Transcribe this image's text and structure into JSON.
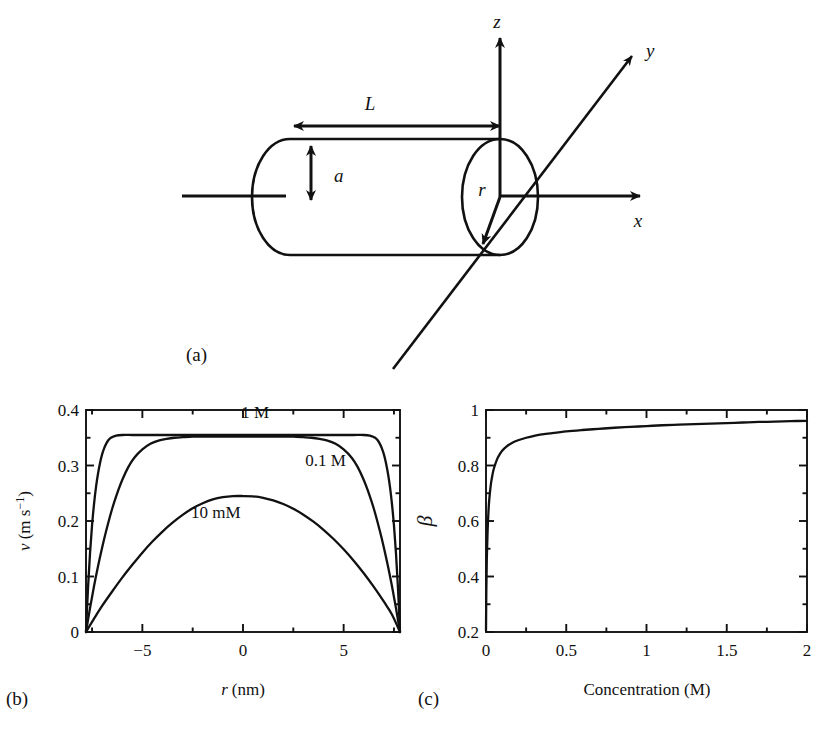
{
  "figure": {
    "panels": [
      {
        "id": "a",
        "label": "(a)"
      },
      {
        "id": "b",
        "label": "(b)"
      },
      {
        "id": "c",
        "label": "(c)"
      }
    ]
  },
  "diagram": {
    "name": "cylindrical-nanopore-schematic",
    "labels": {
      "length": "L",
      "radius_dim": "a",
      "radial_coord": "r",
      "axis_x": "x",
      "axis_y": "y",
      "axis_z": "z"
    }
  },
  "chart_data": [
    {
      "id": "panel-b",
      "type": "line",
      "title": "",
      "xlabel": "r (nm)",
      "xlabel_italic": "r",
      "xlabel_unit": "(nm)",
      "ylabel": "v (m s⁻¹)",
      "ylabel_italic": "v",
      "ylabel_unit": "(m s⁻¹)",
      "xlim": [
        -7.8,
        7.8
      ],
      "ylim": [
        0,
        0.4
      ],
      "xticks": [
        -5,
        0,
        5
      ],
      "xtick_labels": [
        "−5",
        "0",
        "5"
      ],
      "xminorticks": [
        -7.5,
        -2.5,
        2.5,
        7.5
      ],
      "yticks": [
        0,
        0.1,
        0.2,
        0.3,
        0.4
      ],
      "ytick_labels": [
        "0",
        "0.1",
        "0.2",
        "0.3",
        "0.4"
      ],
      "yminorticks": [
        0.05,
        0.15,
        0.25,
        0.35
      ],
      "grid": false,
      "legend_position": "inline-annotations",
      "series": [
        {
          "name": "1 M",
          "label_x": 0.6,
          "label_y": 0.385,
          "plateau": 0.355,
          "x": [
            -7.8,
            -7.7,
            -7.6,
            -7.5,
            -7.4,
            -7.3,
            -7.2,
            -7.1,
            -7.0,
            -6.9,
            -6.8,
            -6.7,
            -6.6,
            -6.5,
            -6.3,
            -6.0,
            -5.5,
            -5.0,
            -4.0,
            -3.0,
            -2.0,
            -1.0,
            0.0,
            1.0,
            2.0,
            3.0,
            4.0,
            5.0,
            5.5,
            6.0,
            6.3,
            6.5,
            6.6,
            6.7,
            6.8,
            6.9,
            7.0,
            7.1,
            7.2,
            7.3,
            7.4,
            7.5,
            7.6,
            7.7,
            7.8
          ],
          "y": [
            0.0,
            0.079,
            0.142,
            0.192,
            0.231,
            0.262,
            0.286,
            0.305,
            0.32,
            0.331,
            0.339,
            0.345,
            0.349,
            0.351,
            0.354,
            0.355,
            0.355,
            0.355,
            0.355,
            0.355,
            0.355,
            0.355,
            0.355,
            0.355,
            0.355,
            0.355,
            0.355,
            0.355,
            0.355,
            0.355,
            0.354,
            0.351,
            0.349,
            0.345,
            0.339,
            0.331,
            0.32,
            0.305,
            0.286,
            0.262,
            0.231,
            0.192,
            0.142,
            0.079,
            0.0
          ]
        },
        {
          "name": "0.1 M",
          "label_x": 4.1,
          "label_y": 0.3,
          "plateau": 0.352,
          "x": [
            -7.8,
            -7.6,
            -7.4,
            -7.2,
            -7.0,
            -6.8,
            -6.5,
            -6.2,
            -6.0,
            -5.7,
            -5.4,
            -5.0,
            -4.6,
            -4.2,
            -3.8,
            -3.4,
            -3.0,
            -2.5,
            -2.0,
            -1.5,
            -1.0,
            -0.5,
            0.0,
            0.5,
            1.0,
            1.5,
            2.0,
            2.5,
            3.0,
            3.4,
            3.8,
            4.2,
            4.6,
            5.0,
            5.4,
            5.7,
            6.0,
            6.2,
            6.5,
            6.8,
            7.0,
            7.2,
            7.4,
            7.6,
            7.8
          ],
          "y": [
            0.0,
            0.043,
            0.083,
            0.119,
            0.152,
            0.182,
            0.222,
            0.255,
            0.274,
            0.297,
            0.314,
            0.329,
            0.339,
            0.345,
            0.348,
            0.35,
            0.351,
            0.352,
            0.352,
            0.352,
            0.352,
            0.352,
            0.352,
            0.352,
            0.352,
            0.352,
            0.352,
            0.352,
            0.351,
            0.35,
            0.348,
            0.345,
            0.339,
            0.329,
            0.314,
            0.297,
            0.274,
            0.255,
            0.222,
            0.182,
            0.152,
            0.119,
            0.083,
            0.043,
            0.0
          ]
        },
        {
          "name": "10 mM",
          "label_x": -1.35,
          "label_y": 0.205,
          "peak": 0.245,
          "x": [
            -7.8,
            -7.4,
            -7.0,
            -6.5,
            -6.0,
            -5.5,
            -5.0,
            -4.5,
            -4.0,
            -3.5,
            -3.0,
            -2.5,
            -2.0,
            -1.5,
            -1.0,
            -0.5,
            0.0,
            0.5,
            1.0,
            1.5,
            2.0,
            2.5,
            3.0,
            3.5,
            4.0,
            4.5,
            5.0,
            5.5,
            6.0,
            6.5,
            7.0,
            7.4,
            7.8
          ],
          "y": [
            0.0,
            0.024,
            0.047,
            0.073,
            0.098,
            0.121,
            0.143,
            0.163,
            0.181,
            0.197,
            0.211,
            0.223,
            0.232,
            0.239,
            0.243,
            0.2449,
            0.245,
            0.2444,
            0.2418,
            0.2372,
            0.2306,
            0.222,
            0.2114,
            0.1988,
            0.1842,
            0.1676,
            0.149,
            0.1284,
            0.1058,
            0.0812,
            0.0546,
            0.0316,
            0.0
          ]
        }
      ]
    },
    {
      "id": "panel-c",
      "type": "line",
      "title": "",
      "xlabel": "Concentration (M)",
      "ylabel": "β",
      "xlim": [
        0,
        2
      ],
      "ylim": [
        0.2,
        1
      ],
      "xticks": [
        0,
        0.5,
        1,
        1.5,
        2
      ],
      "xtick_labels": [
        "0",
        "0.5",
        "1",
        "1.5",
        "2"
      ],
      "xminorticks": [
        0.25,
        0.75,
        1.25,
        1.75
      ],
      "yticks": [
        0.2,
        0.4,
        0.6,
        0.8,
        1
      ],
      "ytick_labels": [
        "0.2",
        "0.4",
        "0.6",
        "0.8",
        "1"
      ],
      "yminorticks": [
        0.3,
        0.5,
        0.7,
        0.9
      ],
      "grid": false,
      "legend_position": "none",
      "series": [
        {
          "name": "beta-vs-concentration",
          "x": [
            0.0,
            0.002,
            0.005,
            0.01,
            0.015,
            0.02,
            0.03,
            0.04,
            0.05,
            0.07,
            0.09,
            0.11,
            0.14,
            0.17,
            0.2,
            0.25,
            0.3,
            0.35,
            0.4,
            0.5,
            0.6,
            0.7,
            0.8,
            0.9,
            1.0,
            1.1,
            1.2,
            1.3,
            1.4,
            1.5,
            1.6,
            1.7,
            1.8,
            1.9,
            2.0
          ],
          "y": [
            0.205,
            0.345,
            0.46,
            0.565,
            0.63,
            0.675,
            0.731,
            0.766,
            0.791,
            0.824,
            0.845,
            0.859,
            0.874,
            0.884,
            0.891,
            0.9,
            0.907,
            0.912,
            0.916,
            0.923,
            0.928,
            0.932,
            0.936,
            0.939,
            0.942,
            0.945,
            0.947,
            0.949,
            0.951,
            0.953,
            0.955,
            0.957,
            0.958,
            0.96,
            0.961
          ]
        }
      ]
    }
  ]
}
